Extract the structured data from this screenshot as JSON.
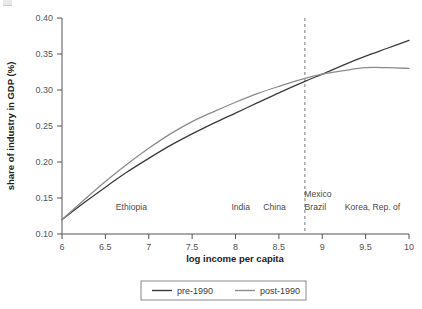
{
  "figure": {
    "corner_mark_name": "figure-crop-mark"
  },
  "chart_data": {
    "type": "line",
    "title": "",
    "xlabel": "log income per capita",
    "ylabel": "share of industry in GDP (%)",
    "xlim": [
      6,
      10
    ],
    "ylim": [
      0.1,
      0.4
    ],
    "grid": false,
    "legend_position": "bottom",
    "xticks": [
      "6",
      "6.5",
      "7",
      "7.5",
      "8",
      "8.5",
      "9",
      "9.5",
      "10"
    ],
    "xtick_values": [
      6,
      6.5,
      7,
      7.5,
      8,
      8.5,
      9,
      9.5,
      10
    ],
    "yticks": [
      "0.40",
      "0.35",
      "0.30",
      "0.25",
      "0.20",
      "0.15",
      "0.10"
    ],
    "ytick_values": [
      0.4,
      0.35,
      0.3,
      0.25,
      0.2,
      0.15,
      0.1
    ],
    "x": [
      6.0,
      6.25,
      6.5,
      6.75,
      7.0,
      7.25,
      7.5,
      7.75,
      8.0,
      8.25,
      8.5,
      8.8,
      9.0,
      9.25,
      9.5,
      9.75,
      10.0
    ],
    "series": [
      {
        "name": "pre-1990",
        "color": "#3b3b3b",
        "values": [
          0.12,
          0.143,
          0.165,
          0.186,
          0.205,
          0.223,
          0.239,
          0.254,
          0.268,
          0.282,
          0.296,
          0.312,
          0.322,
          0.335,
          0.347,
          0.358,
          0.369
        ]
      },
      {
        "name": "post-1990",
        "color": "#8c8c8c",
        "values": [
          0.12,
          0.147,
          0.173,
          0.197,
          0.219,
          0.239,
          0.256,
          0.27,
          0.283,
          0.295,
          0.305,
          0.316,
          0.322,
          0.327,
          0.331,
          0.331,
          0.33
        ]
      }
    ],
    "annotations": [
      {
        "label": "Ethiopia",
        "x": 6.8,
        "y": 0.133
      },
      {
        "label": "India",
        "x": 8.06,
        "y": 0.133
      },
      {
        "label": "China",
        "x": 8.45,
        "y": 0.133
      },
      {
        "label": "Mexico",
        "x": 8.95,
        "y": 0.152
      },
      {
        "label": "Brazil",
        "x": 8.92,
        "y": 0.133
      },
      {
        "label": "Korea, Rep. of",
        "x": 9.58,
        "y": 0.133
      }
    ],
    "reference_line": {
      "name": "threshold-line",
      "orientation": "vertical",
      "x": 8.8,
      "style": "dashed",
      "color": "#777777"
    }
  },
  "legend": {
    "entries": [
      {
        "label": "pre-1990",
        "color": "#3b3b3b"
      },
      {
        "label": "post-1990",
        "color": "#8c8c8c"
      }
    ]
  }
}
